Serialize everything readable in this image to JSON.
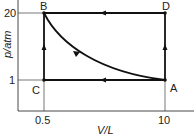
{
  "diagram": {
    "type": "pV cycle",
    "axes": {
      "y_label": "p/atm",
      "x_label": "V/L",
      "y_ticks": [
        "20",
        "1"
      ],
      "x_ticks": [
        "0.5",
        "10"
      ]
    },
    "points": {
      "A": {
        "label": "A",
        "V": 10,
        "p": 1
      },
      "B": {
        "label": "B",
        "V": 0.5,
        "p": 20
      },
      "C": {
        "label": "C",
        "V": 0.5,
        "p": 1
      },
      "D": {
        "label": "D",
        "V": 10,
        "p": 20
      }
    },
    "paths": [
      {
        "from": "A",
        "to": "B",
        "shape": "curve (isotherm)"
      },
      {
        "from": "A",
        "to": "C",
        "shape": "straight"
      },
      {
        "from": "C",
        "to": "B",
        "shape": "straight"
      },
      {
        "from": "A",
        "to": "D",
        "shape": "straight"
      },
      {
        "from": "D",
        "to": "B",
        "shape": "straight"
      }
    ]
  }
}
